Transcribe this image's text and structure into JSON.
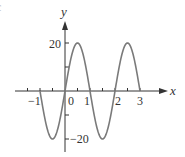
{
  "chart_data": {
    "type": "line",
    "title": "",
    "xlabel": "x",
    "ylabel": "y",
    "xlim": [
      -1.5,
      3.5
    ],
    "ylim": [
      -20,
      20
    ],
    "grid": false,
    "legend": null,
    "x_tick_labels": [
      "−1",
      "0",
      "1",
      "2",
      "3"
    ],
    "x_ticks_minor": [
      -1.5,
      -1,
      -0.5,
      0.5,
      1,
      1.5,
      2,
      2.5,
      3
    ],
    "y_tick_labels": [
      "20",
      "−20"
    ],
    "y_ticks_minor": [
      10,
      -10
    ],
    "function": "y = 20 sin(πx), −1 ≤ x ≤ 3",
    "series": [
      {
        "name": "curve",
        "x": [
          -1,
          -0.5,
          0,
          0.5,
          1,
          1.5,
          2,
          2.5,
          3
        ],
        "y": [
          0,
          -20,
          0,
          20,
          0,
          -20,
          0,
          20,
          0
        ]
      }
    ],
    "colors": {
      "curve": "#7a7a7a",
      "axes": "#333333"
    }
  },
  "labels": {
    "x_axis": "x",
    "y_axis": "y",
    "y_20": "20",
    "y_neg20": "−20",
    "x_neg1": "−1",
    "x_0": "0",
    "x_1": "1",
    "x_2": "2",
    "x_3": "3",
    "corner_fragment": "c"
  }
}
